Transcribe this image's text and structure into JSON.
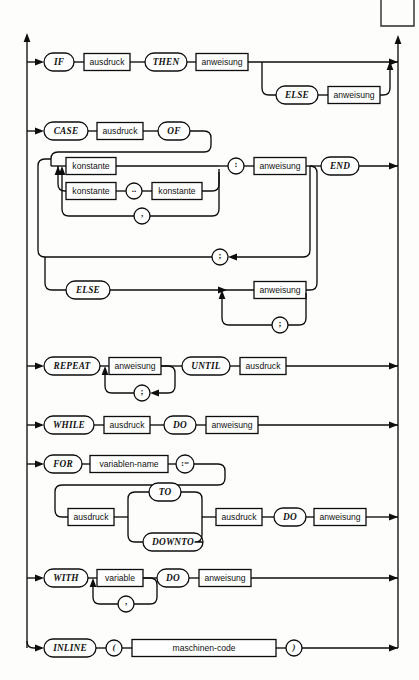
{
  "page": {
    "background_color": "#fdfdfc",
    "ink_color": "#0d0d0d",
    "width": 419,
    "height": 680
  },
  "corner_fragment": {
    "name": "page-corner-box-fragment",
    "description": "clipped rectangle outline at top right of page"
  },
  "rails": {
    "left_label": "entry-rail",
    "right_label": "exit-rail"
  },
  "productions": [
    {
      "id": "if-statement",
      "keywords": [
        "IF",
        "THEN",
        "ELSE"
      ],
      "nonterminals": [
        "ausdruck",
        "anweisung",
        "anweisung"
      ]
    },
    {
      "id": "case-statement",
      "keywords": [
        "CASE",
        "OF",
        "END",
        "ELSE"
      ],
      "nonterminals": [
        "ausdruck",
        "konstante",
        "konstante",
        "konstante",
        "anweisung",
        "anweisung"
      ],
      "punctuation": [
        "..",
        ",",
        ":",
        ";",
        ";"
      ]
    },
    {
      "id": "repeat-statement",
      "keywords": [
        "REPEAT",
        "UNTIL"
      ],
      "nonterminals": [
        "anweisung",
        "ausdruck"
      ],
      "punctuation": [
        ";"
      ]
    },
    {
      "id": "while-statement",
      "keywords": [
        "WHILE",
        "DO"
      ],
      "nonterminals": [
        "ausdruck",
        "anweisung"
      ]
    },
    {
      "id": "for-statement",
      "keywords": [
        "FOR",
        "TO",
        "DOWNTO",
        "DO"
      ],
      "nonterminals": [
        "variablen-name",
        "ausdruck",
        "ausdruck",
        "anweisung"
      ],
      "punctuation": [
        ":="
      ]
    },
    {
      "id": "with-statement",
      "keywords": [
        "WITH",
        "DO"
      ],
      "nonterminals": [
        "variable",
        "anweisung"
      ],
      "punctuation": [
        ","
      ]
    },
    {
      "id": "inline-statement",
      "keywords": [
        "INLINE"
      ],
      "nonterminals": [
        "maschinen-code"
      ],
      "punctuation": [
        "(",
        ")"
      ]
    }
  ],
  "nodes": {
    "if": {
      "kw_if": "IF",
      "nt_ausdruck": "ausdruck",
      "kw_then": "THEN",
      "nt_anweisung": "anweisung",
      "kw_else": "ELSE",
      "nt_else_anweisung": "anweisung"
    },
    "case": {
      "kw_case": "CASE",
      "nt_ausdruck": "ausdruck",
      "kw_of": "OF",
      "nt_konstante1": "konstante",
      "nt_konstante2": "konstante",
      "nt_konstante3": "konstante",
      "sym_range": "..",
      "sym_comma": ",",
      "sym_colon": ":",
      "nt_anweisung": "anweisung",
      "kw_end": "END",
      "sym_semicolon": ";",
      "kw_else": "ELSE",
      "nt_else_anweisung": "anweisung",
      "sym_else_semicolon": ";"
    },
    "repeat": {
      "kw_repeat": "REPEAT",
      "nt_anweisung": "anweisung",
      "sym_semicolon": ";",
      "kw_until": "UNTIL",
      "nt_ausdruck": "ausdruck"
    },
    "while": {
      "kw_while": "WHILE",
      "nt_ausdruck": "ausdruck",
      "kw_do": "DO",
      "nt_anweisung": "anweisung"
    },
    "for": {
      "kw_for": "FOR",
      "nt_variablenname": "variablen-name",
      "sym_assign": ":=",
      "nt_ausdruck1": "ausdruck",
      "kw_to": "TO",
      "kw_downto": "DOWNTO",
      "nt_ausdruck2": "ausdruck",
      "kw_do": "DO",
      "nt_anweisung": "anweisung"
    },
    "with": {
      "kw_with": "WITH",
      "nt_variable": "variable",
      "sym_comma": ",",
      "kw_do": "DO",
      "nt_anweisung": "anweisung"
    },
    "inline": {
      "kw_inline": "INLINE",
      "sym_lparen": "(",
      "nt_maschinencode": "maschinen-code",
      "sym_rparen": ")"
    }
  }
}
